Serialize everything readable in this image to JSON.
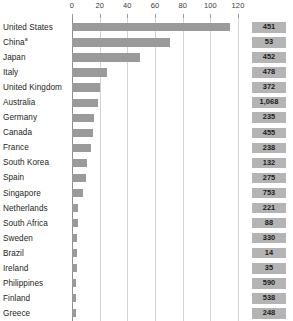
{
  "chart_data": {
    "type": "bar",
    "orientation": "horizontal",
    "title": "",
    "xlabel": "",
    "ylabel": "",
    "xlim": [
      0,
      120
    ],
    "grid": true,
    "legend": "none",
    "xticks": [
      0,
      20,
      40,
      60,
      80,
      100,
      120
    ],
    "xtick_labels": [
      "0",
      "20",
      "40",
      "60",
      "80",
      "100",
      "120"
    ],
    "categories": [
      "United States",
      "China",
      "Japan",
      "Italy",
      "United Kingdom",
      "Australia",
      "Germany",
      "Canada",
      "France",
      "South Korea",
      "Spain",
      "Singapore",
      "Netherlands",
      "South Africa",
      "Sweden",
      "Brazil",
      "Ireland",
      "Philippines",
      "Finland",
      "Greece"
    ],
    "values": [
      114,
      71,
      49,
      25,
      20,
      19,
      16,
      15,
      14,
      11,
      10,
      8,
      4.2,
      4,
      3.8,
      3.6,
      3.5,
      3.2,
      3,
      2.6
    ],
    "badge_values": [
      "451",
      "53",
      "452",
      "478",
      "372",
      "1,068",
      "235",
      "455",
      "238",
      "132",
      "275",
      "753",
      "221",
      "88",
      "330",
      "14",
      "35",
      "590",
      "538",
      "248"
    ],
    "bar_color": "#9a9a9a",
    "badge_color": "#b4b4b4",
    "gridline_color": "#d3d3d3",
    "axis_color": "#8e8e8e"
  },
  "rows": [
    {
      "label": "United States",
      "footnote": "",
      "value": 114,
      "badge": "451"
    },
    {
      "label": "China",
      "footnote": "a",
      "value": 71,
      "badge": "53"
    },
    {
      "label": "Japan",
      "footnote": "",
      "value": 49,
      "badge": "452"
    },
    {
      "label": "Italy",
      "footnote": "",
      "value": 25,
      "badge": "478"
    },
    {
      "label": "United Kingdom",
      "footnote": "",
      "value": 20,
      "badge": "372"
    },
    {
      "label": "Australia",
      "footnote": "",
      "value": 19,
      "badge": "1,068"
    },
    {
      "label": "Germany",
      "footnote": "",
      "value": 16,
      "badge": "235"
    },
    {
      "label": "Canada",
      "footnote": "",
      "value": 15,
      "badge": "455"
    },
    {
      "label": "France",
      "footnote": "",
      "value": 14,
      "badge": "238"
    },
    {
      "label": "South Korea",
      "footnote": "",
      "value": 11,
      "badge": "132"
    },
    {
      "label": "Spain",
      "footnote": "",
      "value": 10,
      "badge": "275"
    },
    {
      "label": "Singapore",
      "footnote": "",
      "value": 8,
      "badge": "753"
    },
    {
      "label": "Netherlands",
      "footnote": "",
      "value": 4.2,
      "badge": "221"
    },
    {
      "label": "South Africa",
      "footnote": "",
      "value": 4,
      "badge": "88"
    },
    {
      "label": "Sweden",
      "footnote": "",
      "value": 3.8,
      "badge": "330"
    },
    {
      "label": "Brazil",
      "footnote": "",
      "value": 3.6,
      "badge": "14"
    },
    {
      "label": "Ireland",
      "footnote": "",
      "value": 3.5,
      "badge": "35"
    },
    {
      "label": "Philippines",
      "footnote": "",
      "value": 3.2,
      "badge": "590"
    },
    {
      "label": "Finland",
      "footnote": "",
      "value": 3,
      "badge": "538"
    },
    {
      "label": "Greece",
      "footnote": "",
      "value": 2.6,
      "badge": "248"
    }
  ]
}
